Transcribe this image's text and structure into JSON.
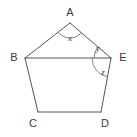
{
  "figure": {
    "kind": "geometry-diagram",
    "shape_name": "pentagon",
    "background_color": "#ffffff",
    "line_color": "#555555",
    "arc_color": "#777777",
    "label_color": "#3b3b3b"
  },
  "vertices": [
    {
      "id": "A",
      "label": "A",
      "x": 70,
      "y": 23,
      "label_x": 70,
      "label_y": 13
    },
    {
      "id": "B",
      "label": "B",
      "x": 25,
      "y": 58,
      "label_x": 14,
      "label_y": 58
    },
    {
      "id": "C",
      "label": "C",
      "x": 38,
      "y": 112,
      "label_x": 33,
      "label_y": 124
    },
    {
      "id": "D",
      "label": "D",
      "x": 101,
      "y": 112,
      "label_x": 105,
      "label_y": 124
    },
    {
      "id": "E",
      "label": "E",
      "x": 111,
      "y": 58,
      "label_x": 123,
      "label_y": 58
    }
  ],
  "edges": [
    {
      "id": "AB",
      "from": "A",
      "to": "B"
    },
    {
      "id": "BC",
      "from": "B",
      "to": "C"
    },
    {
      "id": "CD",
      "from": "C",
      "to": "D"
    },
    {
      "id": "DE",
      "from": "D",
      "to": "E"
    },
    {
      "id": "EA",
      "from": "E",
      "to": "A"
    }
  ],
  "diagonals": [
    {
      "id": "BE",
      "from": "B",
      "to": "E"
    }
  ],
  "angles": [
    {
      "id": "x",
      "label": "x",
      "at_vertex": "A",
      "between": [
        "B",
        "E"
      ],
      "label_x": 70,
      "label_y": 39,
      "arc_radius": 15
    },
    {
      "id": "y",
      "label": "y",
      "at_vertex": "E",
      "between": [
        "A",
        "B"
      ],
      "label_x": 98,
      "label_y": 49,
      "arc_radius": 17
    },
    {
      "id": "z",
      "label": "z",
      "at_vertex": "E",
      "between": [
        "B",
        "D"
      ],
      "label_x": 103,
      "label_y": 73,
      "arc_radius": 19
    }
  ]
}
